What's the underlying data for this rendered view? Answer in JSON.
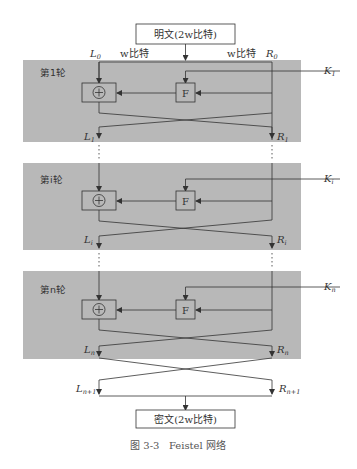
{
  "diagram": {
    "title": "Feistel 网络",
    "input_box": {
      "label": "明文(2w比特)"
    },
    "output_box": {
      "label": "密文(2w比特)"
    },
    "half_labels": {
      "left_width": "w比特",
      "right_width": "w比特"
    },
    "initial": {
      "left": "L",
      "left_sub": "0",
      "right": "R",
      "right_sub": "0"
    },
    "rounds": [
      {
        "label": "第1轮",
        "key": "K",
        "key_sub": "1",
        "left_out": "L",
        "left_out_sub": "1",
        "right_out": "R",
        "right_out_sub": "1",
        "f_label": "F",
        "xor_label": "+"
      },
      {
        "label": "第i轮",
        "key": "K",
        "key_sub": "i",
        "left_out": "L",
        "left_out_sub": "i",
        "right_out": "R",
        "right_out_sub": "i",
        "f_label": "F",
        "xor_label": "+"
      },
      {
        "label": "第n轮",
        "key": "K",
        "key_sub": "n",
        "left_out": "L",
        "left_out_sub": "n",
        "right_out": "R",
        "right_out_sub": "n",
        "f_label": "F",
        "xor_label": "+"
      }
    ],
    "final": {
      "left": "L",
      "left_sub": "n+1",
      "right": "R",
      "right_sub": "n+1"
    },
    "caption": "图 3-3   Feistel 网络",
    "colors": {
      "panel": "#b8b8b8",
      "line": "#333333",
      "box_fill": "#ffffff"
    }
  }
}
